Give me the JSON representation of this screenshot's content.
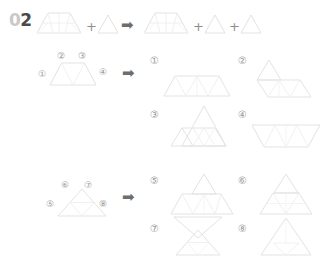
{
  "worksheet": {
    "problem_number": "02",
    "problem_number_parts": {
      "prefix": "0",
      "digit": "2"
    },
    "operators": {
      "plus": "+",
      "arrow": "➡"
    },
    "palette": {
      "shape_stroke": "#e3e3e3",
      "shape_inner_stroke": "#ececec",
      "label_gray": "#9a9a9a",
      "number_dark": "#4a4a4a",
      "number_light": "#c9c9c9",
      "arrow_gray": "#6d6d6d",
      "background": "#ffffff"
    },
    "equation": {
      "left": [
        {
          "shape": "trapezoid-subdivided",
          "label": "trapezoid"
        },
        {
          "shape": "triangle",
          "label": "triangle"
        }
      ],
      "right": [
        {
          "shape": "trapezoid-subdivided",
          "label": "trapezoid"
        },
        {
          "shape": "triangle",
          "label": "triangle"
        },
        {
          "shape": "triangle",
          "label": "triangle"
        }
      ]
    },
    "problems": [
      {
        "id": "problem-a",
        "source_shape": "trapezoid",
        "edge_labels": [
          {
            "num": "①",
            "position": "left"
          },
          {
            "num": "②",
            "position": "top-left"
          },
          {
            "num": "③",
            "position": "top-right"
          },
          {
            "num": "④",
            "position": "right"
          }
        ],
        "answers": [
          {
            "num": "①",
            "shape": "trapezoid-flat"
          },
          {
            "num": "②",
            "shape": "trapezoid-with-triangle-top-left"
          },
          {
            "num": "③",
            "shape": "trapezoid-with-large-triangle"
          },
          {
            "num": "④",
            "shape": "trapezoid-inverted-subdivided"
          }
        ]
      },
      {
        "id": "problem-b",
        "source_shape": "triangle",
        "edge_labels": [
          {
            "num": "⑤",
            "position": "left"
          },
          {
            "num": "⑥",
            "position": "top-left"
          },
          {
            "num": "⑦",
            "position": "top-right"
          },
          {
            "num": "⑧",
            "position": "right"
          }
        ],
        "answers": [
          {
            "num": "⑤",
            "shape": "triangle-over-trapezoid"
          },
          {
            "num": "⑥",
            "shape": "triangle-stacked"
          },
          {
            "num": "⑦",
            "shape": "hourglass-triangles"
          },
          {
            "num": "⑧",
            "shape": "triangle-with-base-band"
          }
        ]
      }
    ]
  }
}
